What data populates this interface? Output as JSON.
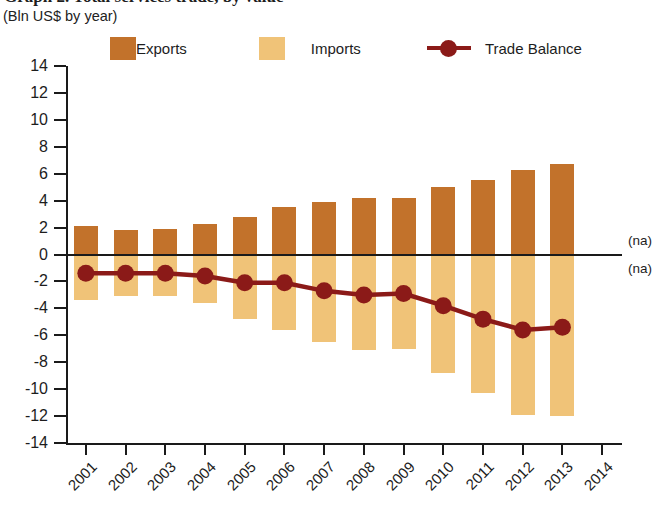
{
  "header": {
    "title": "Graph 2. Total services trade, by value",
    "subtitle": "(Bln US$ by year)"
  },
  "legend": {
    "items": [
      {
        "label": "Exports",
        "color": "#C2722B",
        "marker": "square"
      },
      {
        "label": "Imports",
        "color": "#F0C378",
        "marker": "square"
      },
      {
        "label": "Trade Balance",
        "color": "#8B1A18",
        "marker": "line-dot"
      }
    ]
  },
  "annotations": {
    "na_above": "(na)",
    "na_below": "(na)"
  },
  "chart_data": {
    "type": "bar",
    "title": "Graph 2. Total services trade, by value",
    "subtitle": "(Bln US$ by year)",
    "xlabel": "",
    "ylabel": "Bln US$ by year",
    "ylim": [
      -14,
      14
    ],
    "ytick_step": 2,
    "yticks": [
      14,
      12,
      10,
      8,
      6,
      4,
      2,
      0,
      -2,
      -4,
      -6,
      -8,
      -10,
      -12,
      -14
    ],
    "ytick_labels": [
      "14",
      "12",
      "10",
      "8",
      "6",
      "4",
      "2",
      "0",
      "-2",
      "-4",
      "-6",
      "-8",
      "-10",
      "-12",
      "-14"
    ],
    "categories": [
      "2001",
      "2002",
      "2003",
      "2004",
      "2005",
      "2006",
      "2007",
      "2008",
      "2009",
      "2010",
      "2011",
      "2012",
      "2013",
      "2014"
    ],
    "grid": false,
    "legend_position": "top",
    "series": [
      {
        "name": "Exports",
        "type": "bar",
        "color": "#C2722B",
        "values": [
          2.1,
          1.8,
          1.9,
          2.3,
          2.8,
          3.5,
          3.9,
          4.2,
          4.2,
          5.0,
          5.5,
          6.3,
          6.7,
          null
        ]
      },
      {
        "name": "Imports",
        "type": "bar",
        "color": "#F0C378",
        "values": [
          -3.4,
          -3.1,
          -3.1,
          -3.6,
          -4.8,
          -5.6,
          -6.5,
          -7.1,
          -7.0,
          -8.8,
          -10.3,
          -11.9,
          -12.0,
          null
        ]
      },
      {
        "name": "Trade Balance",
        "type": "line",
        "color": "#8B1A18",
        "values": [
          -1.4,
          -1.4,
          -1.4,
          -1.6,
          -2.1,
          -2.1,
          -2.7,
          -3.0,
          -2.9,
          -3.8,
          -4.8,
          -5.6,
          -5.4,
          null
        ]
      }
    ]
  }
}
